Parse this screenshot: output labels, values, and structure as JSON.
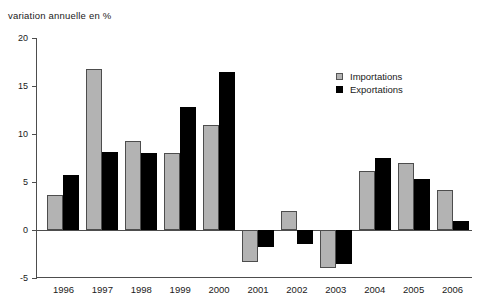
{
  "chart_data": {
    "type": "bar",
    "title": "variation annuelle en %",
    "xlabel": "",
    "ylabel": "",
    "ylim": [
      -5,
      20
    ],
    "yticks": [
      20,
      15,
      10,
      5,
      0,
      -5
    ],
    "grid": false,
    "legend_position": "top-right",
    "categories": [
      "1996",
      "1997",
      "1998",
      "1999",
      "2000",
      "2001",
      "2002",
      "2003",
      "2004",
      "2005",
      "2006"
    ],
    "series": [
      {
        "name": "Importations",
        "color": "#b3b3b3",
        "values": [
          3.6,
          16.8,
          9.3,
          8.0,
          10.9,
          -3.3,
          2.0,
          -4.0,
          6.1,
          7.0,
          4.2
        ]
      },
      {
        "name": "Exportations",
        "color": "#000000",
        "values": [
          5.7,
          8.1,
          8.0,
          12.8,
          16.5,
          -1.8,
          -1.5,
          -3.5,
          7.5,
          5.3,
          0.9
        ]
      }
    ]
  },
  "legend": {
    "items": [
      {
        "label": "Importations",
        "swatch": "imports"
      },
      {
        "label": "Exportations",
        "swatch": "exports"
      }
    ]
  }
}
